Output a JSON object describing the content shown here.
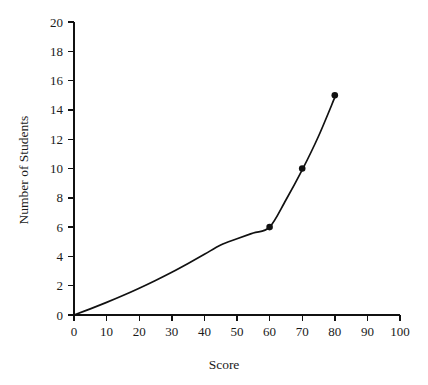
{
  "chart_data": {
    "type": "line",
    "title": "",
    "xlabel": "Score",
    "ylabel": "Number of Students",
    "xlim": [
      0,
      100
    ],
    "ylim": [
      0,
      20
    ],
    "grid": false,
    "legend": null,
    "x_ticks": [
      0,
      10,
      20,
      30,
      40,
      50,
      60,
      70,
      80,
      90,
      100
    ],
    "y_ticks": [
      0,
      2,
      4,
      6,
      8,
      10,
      12,
      14,
      16,
      18,
      20
    ],
    "x_tick_labels": [
      "0",
      "10",
      "20",
      "30",
      "40",
      "50",
      "60",
      "70",
      "80",
      "90",
      "100"
    ],
    "y_tick_labels": [
      "0",
      "2",
      "4",
      "6",
      "8",
      "10",
      "12",
      "14",
      "16",
      "18",
      "20"
    ],
    "marker_style": "filled-circle",
    "line_color": "#111111",
    "marker_color": "#111111",
    "background_color": "#ffffff",
    "series": [
      {
        "name": "cumulative students",
        "x": [
          0,
          60,
          70,
          80
        ],
        "values": [
          0,
          6,
          10,
          15
        ],
        "markers_shown_at": [
          {
            "x": 60,
            "y": 6
          },
          {
            "x": 70,
            "y": 10
          },
          {
            "x": 80,
            "y": 15
          }
        ],
        "curve_samples": {
          "x": [
            0,
            5,
            10,
            15,
            20,
            25,
            30,
            35,
            40,
            45,
            50,
            55,
            60,
            65,
            70,
            75,
            80
          ],
          "y": [
            0,
            0.42,
            0.86,
            1.33,
            1.83,
            2.36,
            2.92,
            3.52,
            4.14,
            4.78,
            5.2,
            5.6,
            6.0,
            7.85,
            9.9,
            12.2,
            14.85
          ]
        }
      }
    ]
  },
  "axes": {
    "x_title": "Score",
    "y_title": "Number of Students"
  }
}
